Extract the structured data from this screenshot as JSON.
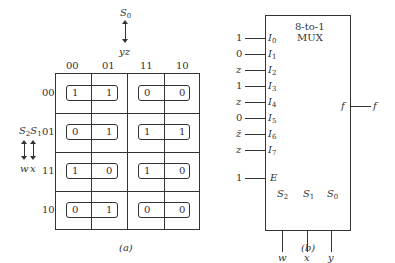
{
  "kmap": {
    "top_var": {
      "label": "S",
      "sub": "0",
      "vars": "yz"
    },
    "side_var": {
      "label1": "S",
      "sub1": "2",
      "label2": "S",
      "sub2": "1",
      "vars": [
        "w",
        "x"
      ]
    },
    "col_headers": [
      "00",
      "01",
      "11",
      "10"
    ],
    "row_headers": [
      "00",
      "01",
      "11",
      "10"
    ],
    "cells": [
      [
        "1",
        "1",
        "0",
        "0"
      ],
      [
        "0",
        "1",
        "1",
        "1"
      ],
      [
        "1",
        "0",
        "1",
        "0"
      ],
      [
        "0",
        "1",
        "0",
        "0"
      ]
    ],
    "caption": "(a)"
  },
  "mux": {
    "title_line1": "8-to-1",
    "title_line2": "MUX",
    "inputs": [
      {
        "value": "1",
        "pin": "I",
        "sub": "0"
      },
      {
        "value": "0",
        "pin": "I",
        "sub": "1"
      },
      {
        "value": "z",
        "pin": "I",
        "sub": "2"
      },
      {
        "value": "1",
        "pin": "I",
        "sub": "3"
      },
      {
        "value": "z",
        "pin": "I",
        "sub": "4"
      },
      {
        "value": "0",
        "pin": "I",
        "sub": "5"
      },
      {
        "value": "z̄",
        "pin": "I",
        "sub": "6"
      },
      {
        "value": "z",
        "pin": "I",
        "sub": "7"
      }
    ],
    "enable": {
      "value": "1",
      "pin": "E"
    },
    "output": {
      "pin": "f",
      "label": "f"
    },
    "selects": [
      {
        "pin": "S",
        "sub": "2",
        "signal": "w"
      },
      {
        "pin": "S",
        "sub": "1",
        "signal": "x"
      },
      {
        "pin": "S",
        "sub": "0",
        "signal": "y"
      }
    ],
    "caption": "(b)"
  }
}
